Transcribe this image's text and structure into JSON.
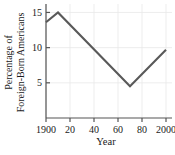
{
  "chart_data": {
    "type": "line",
    "title": "",
    "xlabel": "Year",
    "ylabel_line1": "Percentage of",
    "ylabel_line2": "Foreign-Born Americans",
    "ylabel": "Percentage of Foreign-Born Americans",
    "x": [
      1900,
      1910,
      1970,
      2000
    ],
    "values": [
      13.6,
      15.0,
      4.5,
      9.7
    ],
    "series": [
      {
        "name": "Percentage of Foreign-Born Americans",
        "x": [
          1900,
          1910,
          1970,
          2000
        ],
        "values": [
          13.6,
          15.0,
          4.5,
          9.7
        ]
      }
    ],
    "xticks": [
      1900,
      1920,
      1940,
      1960,
      1980,
      2000
    ],
    "xticklabels": [
      "1900",
      "20",
      "40",
      "60",
      "80",
      "2000"
    ],
    "yticks": [
      5,
      10,
      15
    ],
    "yticklabels": [
      "5",
      "10",
      "15"
    ],
    "xlim": [
      1900,
      2000
    ],
    "ylim": [
      0,
      16.2
    ],
    "grid": "both",
    "legend": "none",
    "line_color": "#595959",
    "grid_color": "#e8e8e8",
    "axis_color": "#555555",
    "text_color": "#1a1a1a"
  }
}
